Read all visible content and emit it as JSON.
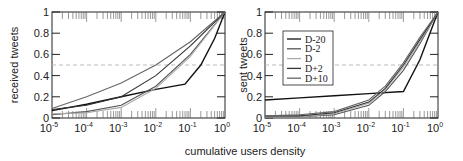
{
  "chart_data": [
    {
      "type": "line",
      "title": "",
      "xlabel": "cumulative users density",
      "ylabel": "received tweets",
      "xscale": "log",
      "xlim": [
        1e-05,
        1
      ],
      "ylim": [
        0,
        1
      ],
      "xticks": [
        "10^-5",
        "10^-4",
        "10^-3",
        "10^-2",
        "10^-1",
        "10^0"
      ],
      "yticks": [
        "0",
        "0.2",
        "0.4",
        "0.6",
        "0.8",
        "1"
      ],
      "reference_line": {
        "y": 0.5,
        "style": "dashed",
        "color": "#bbbbbb"
      },
      "series": [
        {
          "name": "D-20",
          "color": "#111111",
          "x": [
            1e-05,
            0.0001,
            0.001,
            0.01,
            0.07,
            0.2,
            0.5,
            1
          ],
          "y": [
            0.07,
            0.13,
            0.2,
            0.27,
            0.32,
            0.5,
            0.75,
            1
          ]
        },
        {
          "name": "D-2",
          "color": "#555555",
          "x": [
            1e-05,
            0.0001,
            0.001,
            0.01,
            0.1,
            1
          ],
          "y": [
            0.03,
            0.06,
            0.12,
            0.3,
            0.6,
            1
          ]
        },
        {
          "name": "D",
          "color": "#aaaaaa",
          "x": [
            1e-05,
            0.0001,
            0.001,
            0.01,
            0.1,
            1
          ],
          "y": [
            0.04,
            0.05,
            0.1,
            0.28,
            0.58,
            1
          ]
        },
        {
          "name": "D+2",
          "color": "#333333",
          "x": [
            1e-05,
            0.0001,
            0.001,
            0.01,
            0.1,
            1
          ],
          "y": [
            0.08,
            0.12,
            0.2,
            0.4,
            0.68,
            1
          ]
        },
        {
          "name": "D+10",
          "color": "#666666",
          "x": [
            1e-05,
            0.0001,
            0.001,
            0.01,
            0.1,
            1
          ],
          "y": [
            0.09,
            0.2,
            0.33,
            0.5,
            0.72,
            1
          ]
        }
      ]
    },
    {
      "type": "line",
      "title": "",
      "xlabel": "cumulative users density",
      "ylabel": "sent tweets",
      "xscale": "log",
      "xlim": [
        1e-05,
        1
      ],
      "ylim": [
        0,
        1
      ],
      "xticks": [
        "10^-5",
        "10^-4",
        "10^-3",
        "10^-2",
        "10^-1",
        "10^0"
      ],
      "yticks": [
        "0",
        "0.2",
        "0.4",
        "0.6",
        "0.8",
        "1"
      ],
      "reference_line": {
        "y": 0.5,
        "style": "dashed",
        "color": "#bbbbbb"
      },
      "legend": {
        "position": "upper left",
        "entries": [
          "D-20",
          "D-2",
          "D",
          "D+2",
          "D+10"
        ]
      },
      "series": [
        {
          "name": "D-20",
          "color": "#111111",
          "x": [
            1e-05,
            0.0001,
            0.001,
            0.01,
            0.1,
            0.3,
            1
          ],
          "y": [
            0.17,
            0.19,
            0.21,
            0.23,
            0.25,
            0.55,
            1
          ]
        },
        {
          "name": "D-2",
          "color": "#555555",
          "x": [
            1e-05,
            0.0001,
            0.001,
            0.01,
            0.03,
            0.1,
            0.3,
            1
          ],
          "y": [
            0.01,
            0.01,
            0.03,
            0.12,
            0.25,
            0.45,
            0.7,
            1
          ]
        },
        {
          "name": "D",
          "color": "#aaaaaa",
          "x": [
            1e-05,
            0.0001,
            0.001,
            0.01,
            0.03,
            0.1,
            0.3,
            1
          ],
          "y": [
            0.01,
            0.01,
            0.04,
            0.14,
            0.27,
            0.48,
            0.72,
            1
          ]
        },
        {
          "name": "D+2",
          "color": "#333333",
          "x": [
            1e-05,
            0.0001,
            0.001,
            0.01,
            0.03,
            0.1,
            0.3,
            1
          ],
          "y": [
            0.02,
            0.02,
            0.05,
            0.15,
            0.28,
            0.5,
            0.74,
            1
          ]
        },
        {
          "name": "D+10",
          "color": "#666666",
          "x": [
            1e-05,
            0.0001,
            0.001,
            0.01,
            0.03,
            0.1,
            0.3,
            1
          ],
          "y": [
            0.02,
            0.03,
            0.06,
            0.17,
            0.3,
            0.52,
            0.76,
            1
          ]
        }
      ]
    }
  ],
  "labels": {
    "shared_xlabel": "cumulative users density",
    "left_ylabel": "received tweets",
    "right_ylabel": "sent tweets",
    "yticks": [
      "0",
      "0.2",
      "0.4",
      "0.6",
      "0.8",
      "1"
    ],
    "xtick_base": "10",
    "xtick_exps": [
      "-5",
      "-4",
      "-3",
      "-2",
      "-1",
      "0"
    ],
    "legend": [
      "D-20",
      "D-2",
      "D",
      "D+2",
      "D+10"
    ]
  }
}
